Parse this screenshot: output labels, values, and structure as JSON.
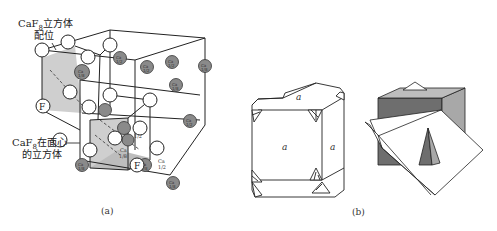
{
  "figure": {
    "panel_a": {
      "caption": "(a)",
      "label_top_line1": "CaF",
      "label_top_sub": "8",
      "label_top_line1_suffix": "立方体",
      "label_top_line2": "配位",
      "label_mid_line1": "CaF",
      "label_mid_sub": "8",
      "label_mid_line1_suffix": "在面心",
      "label_mid_line2": "的立方体",
      "f_label": "F",
      "ca_half": "Ca 1/2",
      "ca_eighth": "Ca 1/8",
      "atom_colors": {
        "F": "#ffffff",
        "Ca": "#8a8a8a",
        "shade": "#c8c8c8"
      }
    },
    "panel_b": {
      "caption": "(b)",
      "face_label": "a",
      "colors": {
        "dark_face": "#6e6e6e",
        "light_face": "#a8a8a8",
        "white": "#ffffff"
      }
    }
  }
}
